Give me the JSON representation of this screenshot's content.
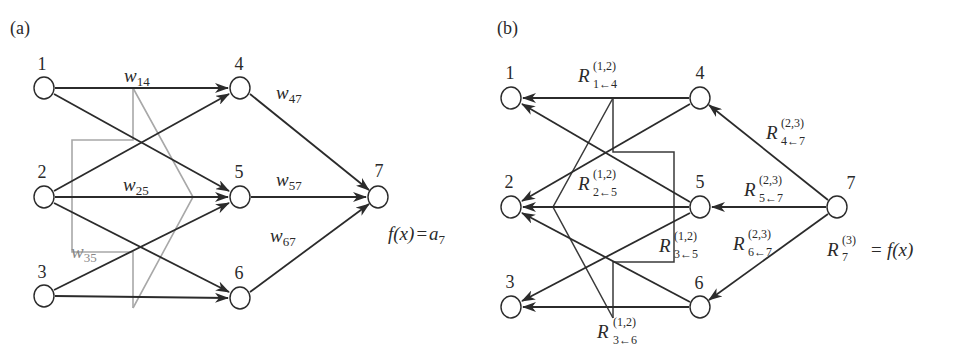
{
  "panels": {
    "a": {
      "label": "(a)",
      "nodes": [
        {
          "id": "1",
          "label": "1",
          "x": 44,
          "y": 88
        },
        {
          "id": "2",
          "label": "2",
          "x": 44,
          "y": 197
        },
        {
          "id": "3",
          "label": "3",
          "x": 44,
          "y": 296
        },
        {
          "id": "4",
          "label": "4",
          "x": 240,
          "y": 88
        },
        {
          "id": "5",
          "label": "5",
          "x": 240,
          "y": 197
        },
        {
          "id": "6",
          "label": "6",
          "x": 240,
          "y": 298
        },
        {
          "id": "7",
          "label": "7",
          "x": 378,
          "y": 197
        }
      ],
      "weights": {
        "w14": {
          "base": "w",
          "sub": "14"
        },
        "w25": {
          "base": "w",
          "sub": "25"
        },
        "w35": {
          "base": "w",
          "sub": "35"
        },
        "w47": {
          "base": "w",
          "sub": "47"
        },
        "w57": {
          "base": "w",
          "sub": "57"
        },
        "w67": {
          "base": "w",
          "sub": "67"
        }
      },
      "output": {
        "lhs": "f(x)",
        "eq": "=",
        "rhs_base": "a",
        "rhs_sub": "7"
      }
    },
    "b": {
      "label": "(b)",
      "nodes": [
        {
          "id": "1",
          "label": "1"
        },
        {
          "id": "2",
          "label": "2"
        },
        {
          "id": "3",
          "label": "3"
        },
        {
          "id": "4",
          "label": "4"
        },
        {
          "id": "5",
          "label": "5"
        },
        {
          "id": "6",
          "label": "6"
        },
        {
          "id": "7",
          "label": "7"
        }
      ],
      "relevances": {
        "r14": {
          "base": "R",
          "sup": "(1,2)",
          "sub": "1←4"
        },
        "r25": {
          "base": "R",
          "sup": "(1,2)",
          "sub": "2←5"
        },
        "r35": {
          "base": "R",
          "sup": "(1,2)",
          "sub": "3←5"
        },
        "r36": {
          "base": "R",
          "sup": "(1,2)",
          "sub": "3←6"
        },
        "r47": {
          "base": "R",
          "sup": "(2,3)",
          "sub": "4←7"
        },
        "r57": {
          "base": "R",
          "sup": "(2,3)",
          "sub": "5←7"
        },
        "r67": {
          "base": "R",
          "sup": "(2,3)",
          "sub": "6←7"
        }
      },
      "output": {
        "base": "R",
        "sup": "(3)",
        "sub": "7",
        "eq": "=",
        "rhs": "f(x)"
      }
    }
  },
  "colors": {
    "edge": "#2b2b2b",
    "pointer_a": "#a8a8a8",
    "pointer_b": "#3a3a3a",
    "node_fill": "#ffffff",
    "node_stroke": "#2b2b2b"
  }
}
